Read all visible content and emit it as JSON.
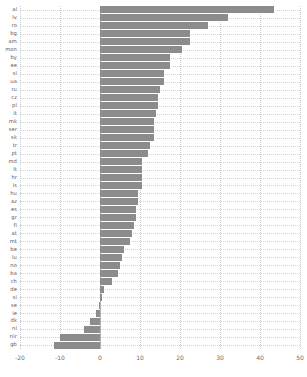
{
  "chart_data": {
    "type": "bar",
    "orientation": "horizontal",
    "title": "",
    "subtitle": "",
    "xlabel": "",
    "ylabel": "",
    "xlim": [
      -20,
      50
    ],
    "ylim": null,
    "grid": true,
    "legend": null,
    "legend_position": "none",
    "bar_color": "#8c8c8c",
    "axis_tick_color": "#6d6d6d",
    "gridline_color": "#c9c9c9",
    "xticks": [
      -20,
      -10,
      0,
      10,
      20,
      30,
      40,
      50
    ],
    "xticklabels": [
      "-20",
      "-10",
      "0",
      "10",
      "20",
      "30",
      "40",
      "50"
    ],
    "categories": [
      "al",
      "lv",
      "ro",
      "bg",
      "am",
      "mon",
      "by",
      "ee",
      "si",
      "ua",
      "ru",
      "cz",
      "pl",
      "it",
      "mk",
      "ser",
      "sk",
      "tr",
      "pt",
      "md",
      "lt",
      "hr",
      "is",
      "hu",
      "az",
      "es",
      "gr",
      "fi",
      "at",
      "mt",
      "be",
      "lu",
      "no",
      "ba",
      "ch",
      "de",
      "si2",
      "se",
      "ie",
      "dk",
      "nl",
      "nir",
      "gb"
    ],
    "categories_display": [
      "al",
      "lv",
      "ro",
      "bg",
      "am",
      "mon",
      "by",
      "ee",
      "si",
      "ua",
      "ru",
      "cz",
      "pl",
      "it",
      "mk",
      "ser",
      "sk",
      "tr",
      "pt",
      "md",
      "lt",
      "hr",
      "is",
      "hu",
      "az",
      "es",
      "gr",
      "fi",
      "at",
      "mt",
      "be",
      "lu",
      "no",
      "ba",
      "ch",
      "de",
      "si",
      "se",
      "ie",
      "dk",
      "nl",
      "nir",
      "gb"
    ],
    "values": [
      43.5,
      32.0,
      27.0,
      22.5,
      22.5,
      20.5,
      17.5,
      17.5,
      16.0,
      16.0,
      15.0,
      14.5,
      14.5,
      14.0,
      13.5,
      13.5,
      13.5,
      12.5,
      12.0,
      10.5,
      10.5,
      10.5,
      10.5,
      9.5,
      9.5,
      9.0,
      9.0,
      8.5,
      8.0,
      7.5,
      6.0,
      5.5,
      5.0,
      4.5,
      3.0,
      1.0,
      0.4,
      -0.3,
      -1.0,
      -2.5,
      -4.0,
      -10.0,
      -11.5
    ]
  }
}
